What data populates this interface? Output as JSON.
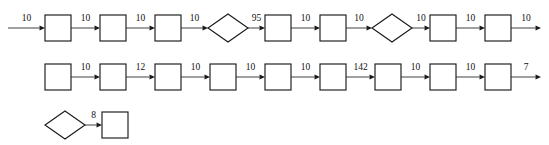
{
  "diagram": {
    "type": "flowchart",
    "title": "",
    "background_color": "#ffffff",
    "node_fill": "#ffffff",
    "node_stroke": "#1a1a1a",
    "edge_color": "#4a4a4a",
    "label_color": "#111111",
    "rows": [
      {
        "id": "row-1",
        "y_center": 28,
        "start_x": 8,
        "end_x": 541,
        "nodes": [
          {
            "id": "r1-n1",
            "shape": "rect",
            "x": 45,
            "label": ""
          },
          {
            "id": "r1-n2",
            "shape": "rect",
            "x": 100,
            "label": ""
          },
          {
            "id": "r1-n3",
            "shape": "rect",
            "x": 155,
            "label": ""
          },
          {
            "id": "r1-n4",
            "shape": "diamond",
            "x": 208,
            "label": ""
          },
          {
            "id": "r1-n5",
            "shape": "rect",
            "x": 265,
            "label": ""
          },
          {
            "id": "r1-n6",
            "shape": "rect",
            "x": 320,
            "label": ""
          },
          {
            "id": "r1-n7",
            "shape": "diamond",
            "x": 372,
            "label": ""
          },
          {
            "id": "r1-n8",
            "shape": "rect",
            "x": 430,
            "label": ""
          },
          {
            "id": "r1-n9",
            "shape": "rect",
            "x": 485,
            "label": ""
          }
        ],
        "edges": [
          {
            "id": "r1-e0",
            "label": "10"
          },
          {
            "id": "r1-e1",
            "label": "10"
          },
          {
            "id": "r1-e2",
            "label": "10"
          },
          {
            "id": "r1-e3",
            "label": "10"
          },
          {
            "id": "r1-e4",
            "label": "95"
          },
          {
            "id": "r1-e5",
            "label": "10"
          },
          {
            "id": "r1-e6",
            "label": "10"
          },
          {
            "id": "r1-e7",
            "label": "10"
          },
          {
            "id": "r1-e8",
            "label": "10"
          },
          {
            "id": "r1-e9",
            "label": "10"
          }
        ]
      },
      {
        "id": "row-2",
        "y_center": 77,
        "start_x": null,
        "end_x": 541,
        "nodes": [
          {
            "id": "r2-n1",
            "shape": "rect",
            "x": 45,
            "label": ""
          },
          {
            "id": "r2-n2",
            "shape": "rect",
            "x": 100,
            "label": ""
          },
          {
            "id": "r2-n3",
            "shape": "rect",
            "x": 155,
            "label": ""
          },
          {
            "id": "r2-n4",
            "shape": "rect",
            "x": 210,
            "label": ""
          },
          {
            "id": "r2-n5",
            "shape": "rect",
            "x": 265,
            "label": ""
          },
          {
            "id": "r2-n6",
            "shape": "rect",
            "x": 320,
            "label": ""
          },
          {
            "id": "r2-n7",
            "shape": "rect",
            "x": 375,
            "label": ""
          },
          {
            "id": "r2-n8",
            "shape": "rect",
            "x": 430,
            "label": ""
          },
          {
            "id": "r2-n9",
            "shape": "rect",
            "x": 485,
            "label": ""
          }
        ],
        "edges": [
          {
            "id": "r2-e1",
            "label": "10"
          },
          {
            "id": "r2-e2",
            "label": "12"
          },
          {
            "id": "r2-e3",
            "label": "10"
          },
          {
            "id": "r2-e4",
            "label": "10"
          },
          {
            "id": "r2-e5",
            "label": "10"
          },
          {
            "id": "r2-e6",
            "label": "142"
          },
          {
            "id": "r2-e7",
            "label": "10"
          },
          {
            "id": "r2-e8",
            "label": "10"
          },
          {
            "id": "r2-e9",
            "label": "7"
          }
        ]
      },
      {
        "id": "row-3",
        "y_center": 125,
        "start_x": null,
        "end_x": null,
        "nodes": [
          {
            "id": "r3-n1",
            "shape": "diamond",
            "x": 45,
            "label": ""
          },
          {
            "id": "r3-n2",
            "shape": "rect",
            "x": 102,
            "label": ""
          }
        ],
        "edges": [
          {
            "id": "r3-e1",
            "label": "8"
          }
        ]
      }
    ]
  }
}
